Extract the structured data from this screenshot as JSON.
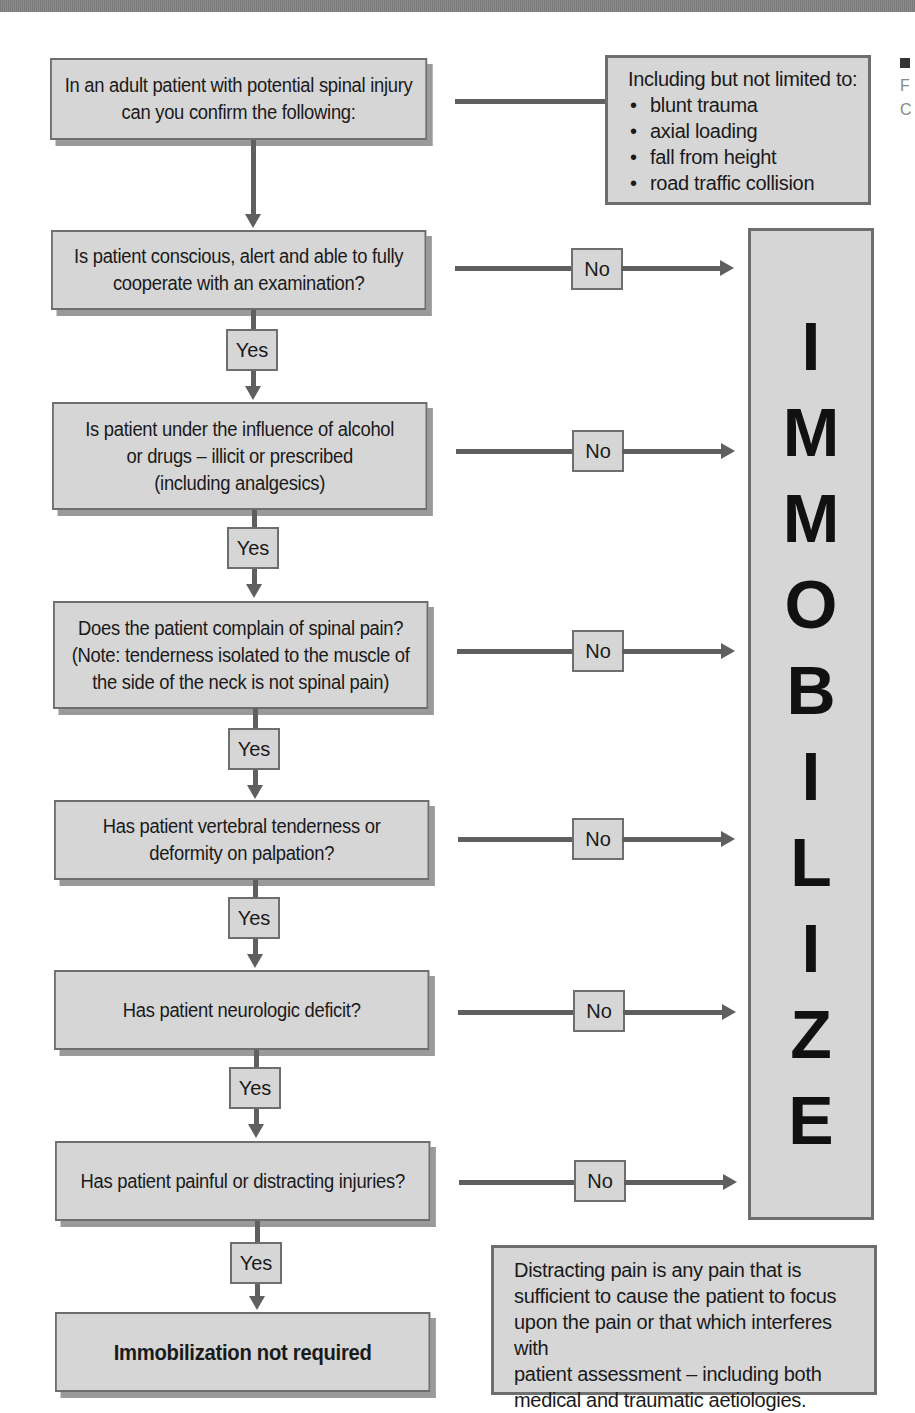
{
  "flowchart": {
    "start": {
      "text_lines": [
        "In an adult patient with potential spinal injury",
        "can you confirm the following:"
      ]
    },
    "mechanisms_note": {
      "title": "Including but not limited to:",
      "items": [
        "blunt trauma",
        "axial loading",
        "fall from height",
        "road traffic collision"
      ]
    },
    "questions": [
      {
        "lines": [
          "Is patient conscious, alert and able to fully",
          "cooperate with an examination?"
        ],
        "no_label": "No",
        "yes_label": "Yes"
      },
      {
        "lines": [
          "Is patient under the influence of alcohol",
          "or drugs – illicit or prescribed",
          "(including analgesics)"
        ],
        "no_label": "No",
        "yes_label": "Yes"
      },
      {
        "lines": [
          "Does the patient complain of spinal pain?",
          "(Note: tenderness isolated to the muscle of",
          "the side of the neck is not spinal pain)"
        ],
        "no_label": "No",
        "yes_label": "Yes"
      },
      {
        "lines": [
          "Has patient vertebral tenderness or",
          "deformity on palpation?"
        ],
        "no_label": "No",
        "yes_label": "Yes"
      },
      {
        "lines": [
          "Has patient neurologic deficit?"
        ],
        "no_label": "No",
        "yes_label": "Yes"
      },
      {
        "lines": [
          "Has patient painful or distracting injuries?"
        ],
        "no_label": "No",
        "yes_label": "Yes"
      }
    ],
    "outcome_yes": "Immobilization not required",
    "outcome_no": {
      "letters": [
        "I",
        "M",
        "M",
        "O",
        "B",
        "I",
        "L",
        "I",
        "Z",
        "E"
      ],
      "word": "IMMOBILIZE"
    },
    "distracting_pain_note": {
      "lines": [
        "Distracting pain is any pain that is",
        "sufficient to cause the patient to focus",
        "upon the pain or that which interferes with",
        "patient assessment – including both",
        "medical and traumatic aetiologies."
      ]
    },
    "edge_fragment": [
      "F",
      "C"
    ]
  },
  "colors": {
    "box_fill": "#d6d6d6",
    "box_border": "#6e6e6e",
    "connector": "#5f5f5f",
    "shadow": "#9a9a9a",
    "text": "#1a1a1a"
  }
}
